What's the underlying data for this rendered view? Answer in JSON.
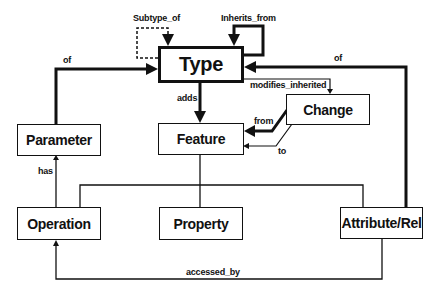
{
  "nodes": {
    "type": "Type",
    "feature": "Feature",
    "change": "Change",
    "parameter": "Parameter",
    "operation": "Operation",
    "property": "Property",
    "attribute_rel": "Attribute/Rel"
  },
  "edges": {
    "subtype_of": "Subtype_of",
    "inherits_from": "Inherits_from",
    "param_of": "of",
    "attr_of": "of",
    "adds": "adds",
    "modifies_inherited": "modifies_inherited",
    "from": "from",
    "to": "to",
    "has": "has",
    "accessed_by": "accessed_by"
  },
  "colors": {
    "line": "#111111",
    "background": "#ffffff"
  }
}
